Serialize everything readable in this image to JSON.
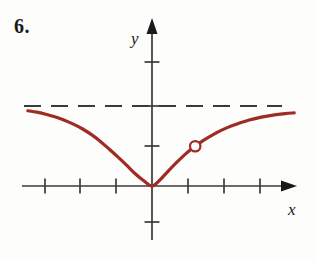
{
  "figure": {
    "problem_number": "6.",
    "axis_labels": {
      "x": "x",
      "y": "y"
    },
    "colors": {
      "curve": "#9e2b25",
      "axis": "#3a3a3a",
      "asymptote": "#3a3a3a",
      "background": "#fdfdfc",
      "text": "#1a1a1a"
    }
  },
  "chart_data": {
    "type": "line",
    "title": "",
    "xlabel": "x",
    "ylabel": "y",
    "grid": false,
    "legend": null,
    "xlim": [
      -3.5,
      4.3
    ],
    "ylim": [
      -1.2,
      3.6
    ],
    "x_ticks": [
      -3,
      -2,
      -1,
      1,
      2,
      3
    ],
    "y_ticks": [
      -1,
      1,
      2,
      3
    ],
    "annotations": [
      {
        "kind": "asymptote",
        "orientation": "horizontal",
        "y": 2.25,
        "style": "dashed",
        "label": ""
      },
      {
        "kind": "open-point",
        "x": 1.2,
        "y": 1.12,
        "label": ""
      }
    ],
    "series": [
      {
        "name": "curve",
        "style": "solid",
        "color": "#9e2b25",
        "x": [
          -3.45,
          -3.2,
          -2.95,
          -2.7,
          -2.45,
          -2.2,
          -1.95,
          -1.7,
          -1.45,
          -1.2,
          -0.95,
          -0.7,
          -0.45,
          -0.22,
          0.0,
          0.22,
          0.45,
          0.7,
          0.95,
          1.2,
          1.45,
          1.7,
          1.95,
          2.2,
          2.45,
          2.7,
          2.95,
          3.2,
          3.45,
          3.7,
          3.95
        ],
        "y": [
          2.12,
          2.08,
          2.02,
          1.95,
          1.86,
          1.75,
          1.62,
          1.46,
          1.27,
          1.05,
          0.82,
          0.58,
          0.33,
          0.14,
          0.0,
          0.17,
          0.42,
          0.68,
          0.92,
          1.12,
          1.3,
          1.45,
          1.58,
          1.69,
          1.78,
          1.86,
          1.92,
          1.97,
          2.01,
          2.04,
          2.06
        ]
      }
    ]
  }
}
